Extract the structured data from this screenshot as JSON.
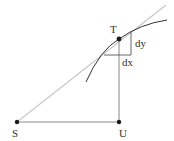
{
  "diagram": {
    "points": {
      "S": {
        "label": "S"
      },
      "T": {
        "label": "T"
      },
      "U": {
        "label": "U"
      }
    },
    "increments": {
      "dy": "dy",
      "dx": "dx"
    },
    "colors": {
      "curve": "#333333",
      "tangent": "#c8c8c8",
      "segments": "#888888",
      "points": "#1a1a1a",
      "labels": "#333333"
    }
  }
}
